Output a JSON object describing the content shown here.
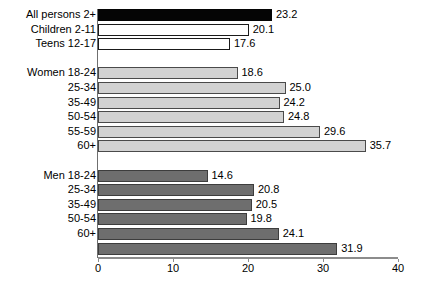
{
  "chart_data": {
    "type": "bar",
    "orientation": "horizontal",
    "title": "",
    "xlabel": "",
    "ylabel": "",
    "xlim": [
      0,
      40
    ],
    "xticks": [
      0,
      10,
      20,
      30,
      40
    ],
    "xtick_labels": [
      "0",
      "10",
      "20",
      "30",
      "40"
    ],
    "grid": false,
    "legend": "none",
    "groups": [
      {
        "name": "overall",
        "bars": [
          {
            "label": "All persons 2+",
            "value": 23.2,
            "value_text": "23.2",
            "style": "black"
          },
          {
            "label": "Children 2-11",
            "value": 20.1,
            "value_text": "20.1",
            "style": "white"
          },
          {
            "label": "Teens 12-17",
            "value": 17.6,
            "value_text": "17.6",
            "style": "white"
          }
        ]
      },
      {
        "name": "women",
        "bars": [
          {
            "label": "Women 18-24",
            "value": 18.6,
            "value_text": "18.6",
            "style": "lightgray"
          },
          {
            "label": "25-34",
            "value": 25.0,
            "value_text": "25.0",
            "style": "lightgray"
          },
          {
            "label": "35-49",
            "value": 24.2,
            "value_text": "24.2",
            "style": "lightgray"
          },
          {
            "label": "50-54",
            "value": 24.8,
            "value_text": "24.8",
            "style": "lightgray"
          },
          {
            "label": "55-59",
            "value": 29.6,
            "value_text": "29.6",
            "style": "lightgray"
          },
          {
            "label": "60+",
            "value": 35.7,
            "value_text": "35.7",
            "style": "lightgray"
          }
        ]
      },
      {
        "name": "men",
        "bars": [
          {
            "label": "Men 18-24",
            "value": 14.6,
            "value_text": "14.6",
            "style": "darkgray"
          },
          {
            "label": "25-34",
            "value": 20.8,
            "value_text": "20.8",
            "style": "darkgray"
          },
          {
            "label": "35-49",
            "value": 20.5,
            "value_text": "20.5",
            "style": "darkgray"
          },
          {
            "label": "50-54",
            "value": 19.8,
            "value_text": "19.8",
            "style": "darkgray"
          },
          {
            "label": "60+",
            "value": 24.1,
            "value_text": "24.1",
            "style": "darkgray"
          },
          {
            "label": "",
            "value": 31.9,
            "value_text": "31.9",
            "style": "darkgray"
          }
        ]
      }
    ],
    "categories": [
      "All persons 2+",
      "Children 2-11",
      "Teens 12-17",
      "Women 18-24",
      "25-34",
      "35-49",
      "50-54",
      "55-59",
      "60+",
      "Men 18-24",
      "25-34",
      "35-49",
      "50-54",
      "60+",
      ""
    ],
    "values": [
      23.2,
      20.1,
      17.6,
      18.6,
      25.0,
      24.2,
      24.8,
      29.6,
      35.7,
      14.6,
      20.8,
      20.5,
      19.8,
      24.1,
      31.9
    ],
    "colors": {
      "black": "#050505",
      "white": "#ffffff",
      "lightgray": "#d2d2d2",
      "darkgray": "#6e6e6e",
      "axis": "#8c8c8c",
      "text": "#000000"
    }
  }
}
